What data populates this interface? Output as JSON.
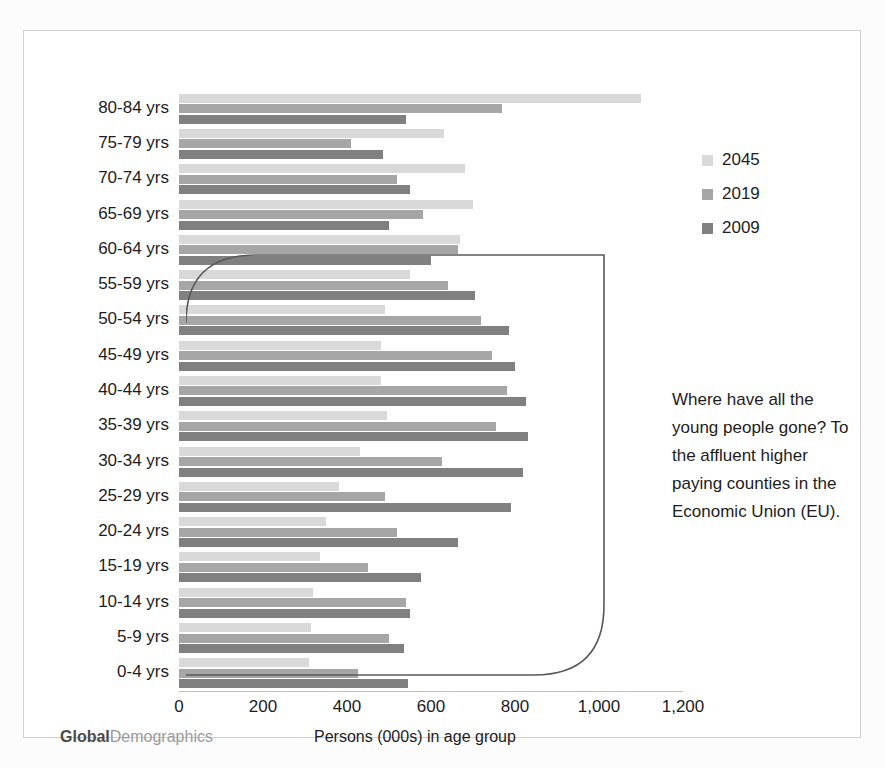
{
  "branding": {
    "bold": "Global",
    "light": "Demographics"
  },
  "legend": {
    "position": "right",
    "items": [
      {
        "label": "2045",
        "color": "#d9d9d9"
      },
      {
        "label": "2019",
        "color": "#a6a6a6"
      },
      {
        "label": "2009",
        "color": "#808080"
      }
    ]
  },
  "annotation": {
    "text": "Where have all the young people gone? To the affluent higher paying counties in the Economic Union (EU)."
  },
  "chart_data": {
    "type": "bar",
    "orientation": "horizontal",
    "title": "",
    "subtitle": "",
    "xlabel": "Persons (000s) in age group",
    "ylabel": "",
    "xlim": [
      0,
      1200
    ],
    "xticks": [
      0,
      200,
      400,
      600,
      800,
      1000,
      1200
    ],
    "xticklabels": [
      "0",
      "200",
      "400",
      "600",
      "800",
      "1,000",
      "1,200"
    ],
    "grid": false,
    "legend_position": "right",
    "categories": [
      "80-84 yrs",
      "75-79 yrs",
      "70-74 yrs",
      "65-69 yrs",
      "60-64 yrs",
      "55-59 yrs",
      "50-54 yrs",
      "45-49 yrs",
      "40-44 yrs",
      "35-39 yrs",
      "30-34 yrs",
      "25-29 yrs",
      "20-24 yrs",
      "15-19 yrs",
      "10-14 yrs",
      "5-9 yrs",
      "0-4 yrs"
    ],
    "series": [
      {
        "name": "2045",
        "color": "#d9d9d9",
        "values": [
          1100,
          630,
          680,
          700,
          670,
          550,
          490,
          480,
          480,
          495,
          430,
          380,
          350,
          335,
          320,
          315,
          310
        ]
      },
      {
        "name": "2019",
        "color": "#a6a6a6",
        "values": [
          770,
          410,
          520,
          580,
          665,
          640,
          720,
          745,
          780,
          755,
          625,
          490,
          520,
          450,
          540,
          500,
          425
        ]
      },
      {
        "name": "2009",
        "color": "#808080",
        "values": [
          540,
          485,
          550,
          500,
          600,
          705,
          785,
          800,
          825,
          830,
          820,
          790,
          665,
          575,
          550,
          535,
          545
        ]
      }
    ]
  }
}
